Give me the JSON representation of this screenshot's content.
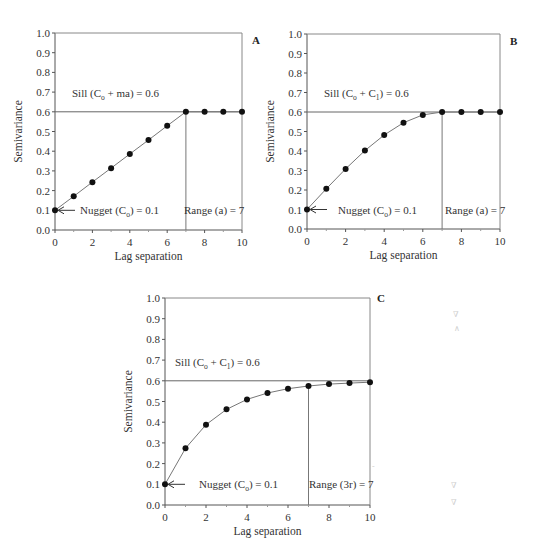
{
  "chart_data": [
    {
      "panel": "A",
      "type": "line",
      "model": "linear",
      "x": [
        0,
        1,
        2,
        3,
        4,
        5,
        6,
        7,
        8,
        9,
        10
      ],
      "series": [
        {
          "name": "Semivariance",
          "values": [
            0.1,
            0.171,
            0.243,
            0.314,
            0.386,
            0.457,
            0.529,
            0.6,
            0.6,
            0.6,
            0.6
          ]
        }
      ],
      "xlabel": "Lag separation",
      "ylabel": "Semivariance",
      "xlim": [
        0,
        10
      ],
      "ylim": [
        0.0,
        1.0
      ],
      "x_ticks": [
        "0",
        "2",
        "4",
        "6",
        "8",
        "10"
      ],
      "y_ticks": [
        "0.0",
        "0.1",
        "0.2",
        "0.3",
        "0.4",
        "0.5",
        "0.6",
        "0.7",
        "0.8",
        "0.9",
        "1.0"
      ],
      "grid": false,
      "sill": 0.6,
      "range": 7,
      "annotations": {
        "sill_label": {
          "pre": "Sill (C",
          "sub": "o",
          "post": " + ma) = 0.6"
        },
        "nugget_label": {
          "pre": "Nugget (C",
          "sub": "o",
          "post": ") = 0.1"
        },
        "range_label": "Range (a) = 7"
      }
    },
    {
      "panel": "B",
      "type": "line",
      "model": "spherical",
      "x": [
        0,
        1,
        2,
        3,
        4,
        5,
        6,
        7,
        8,
        9,
        10
      ],
      "series": [
        {
          "name": "Semivariance",
          "values": [
            0.1,
            0.206,
            0.308,
            0.402,
            0.482,
            0.545,
            0.585,
            0.6,
            0.6,
            0.6,
            0.6
          ]
        }
      ],
      "xlabel": "Lag separation",
      "ylabel": "Semivariance",
      "xlim": [
        0,
        10
      ],
      "ylim": [
        0.0,
        1.0
      ],
      "x_ticks": [
        "0",
        "2",
        "4",
        "6",
        "8",
        "10"
      ],
      "y_ticks": [
        "0.0",
        "0.1",
        "0.2",
        "0.3",
        "0.4",
        "0.5",
        "0.6",
        "0.7",
        "0.8",
        "0.9",
        "1.0"
      ],
      "grid": false,
      "sill": 0.6,
      "range": 7,
      "annotations": {
        "sill_label": {
          "pre": "Sill (C",
          "sub": "o",
          "mid": " + C",
          "sub2": "1",
          "post": ") = 0.6"
        },
        "nugget_label": {
          "pre": "Nugget (C",
          "sub": "o",
          "post": ") = 0.1"
        },
        "range_label": "Range (a) = 7"
      }
    },
    {
      "panel": "C",
      "type": "line",
      "model": "exponential",
      "x": [
        0,
        1,
        2,
        3,
        4,
        5,
        6,
        7,
        8,
        9,
        10
      ],
      "series": [
        {
          "name": "Semivariance",
          "values": [
            0.1,
            0.274,
            0.388,
            0.462,
            0.51,
            0.541,
            0.562,
            0.575,
            0.584,
            0.589,
            0.593
          ]
        }
      ],
      "xlabel": "Lag separation",
      "ylabel": "Semivariance",
      "xlim": [
        0,
        10
      ],
      "ylim": [
        0.0,
        1.0
      ],
      "x_ticks": [
        "0",
        "2",
        "4",
        "6",
        "8",
        "10"
      ],
      "y_ticks": [
        "0.0",
        "0.1",
        "0.2",
        "0.3",
        "0.4",
        "0.5",
        "0.6",
        "0.7",
        "0.8",
        "0.9",
        "1.0"
      ],
      "grid": false,
      "sill": 0.6,
      "range": 7,
      "annotations": {
        "sill_label": {
          "pre": "Sill (C",
          "sub": "o",
          "mid": " + C",
          "sub2": "1",
          "post": ") = 0.6"
        },
        "nugget_label": {
          "pre": "Nugget (C",
          "sub": "o",
          "post": ") = 0.1"
        },
        "range_label": "Range (3r) = 7"
      }
    }
  ],
  "layout": {
    "panels": [
      {
        "x0": 55,
        "x1": 242,
        "y0": 230,
        "y1": 33,
        "label_x": 252,
        "label_y": 44,
        "sill_label_x": 72,
        "sill_label_y": 97,
        "range_label_x": 184,
        "nugget_label_x": 80
      },
      {
        "x0": 307,
        "x1": 500,
        "y0": 229,
        "y1": 34,
        "label_x": 510,
        "label_y": 45,
        "sill_label_x": 324,
        "sill_label_y": 97,
        "range_label_x": 445,
        "nugget_label_x": 338
      },
      {
        "x0": 165,
        "x1": 370,
        "y0": 505,
        "y1": 298,
        "label_x": 377,
        "label_y": 302,
        "sill_label_x": 175,
        "sill_label_y": 366,
        "range_label_x": 309,
        "nugget_label_x": 199
      }
    ],
    "line_color": "#777777",
    "marker_color": "#111111",
    "axis_color": "#555555"
  }
}
